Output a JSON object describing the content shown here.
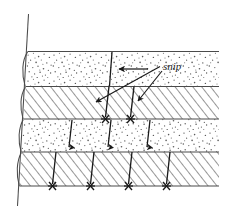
{
  "figure": {
    "kind": "technical-line-drawing",
    "background_color": "#ffffff",
    "ink_color": "#1a1a1a"
  },
  "annotations": [
    {
      "id": "snip-label",
      "text": "snip",
      "style": "italic",
      "x": 163,
      "y": 66,
      "leaders": 2
    }
  ],
  "courses": [
    {
      "index": 0,
      "fill": "stipple",
      "top": 51,
      "bottom": 86,
      "label": "upper-stipple-course"
    },
    {
      "index": 1,
      "fill": "hatch",
      "top": 86,
      "bottom": 119,
      "label": "upper-hatch-course"
    },
    {
      "index": 2,
      "fill": "stipple",
      "top": 119,
      "bottom": 152,
      "label": "lower-stipple-course"
    },
    {
      "index": 3,
      "fill": "hatch",
      "top": 152,
      "bottom": 186,
      "label": "lower-hatch-course"
    }
  ],
  "edge": {
    "label": "left-selvage-edge",
    "top_x": 27,
    "bottom_x": 18,
    "top_y": 15,
    "bottom_y": 205,
    "loops": 4
  },
  "snip_lines": [
    {
      "course": 1,
      "x_top": 109,
      "x_bottom": 105,
      "terminal": "star"
    },
    {
      "course": 1,
      "x_top": 134,
      "x_bottom": 130,
      "terminal": "star"
    },
    {
      "course": 2,
      "x_top": 72,
      "x_bottom": 69,
      "terminal": "arrow"
    },
    {
      "course": 2,
      "x_top": 111,
      "x_bottom": 108,
      "terminal": "arrow"
    },
    {
      "course": 2,
      "x_top": 150,
      "x_bottom": 147,
      "terminal": "arrow"
    },
    {
      "course": 3,
      "x_top": 56,
      "x_bottom": 52,
      "terminal": "star"
    },
    {
      "course": 3,
      "x_top": 94,
      "x_bottom": 90,
      "terminal": "star"
    },
    {
      "course": 3,
      "x_top": 132,
      "x_bottom": 128,
      "terminal": "star"
    },
    {
      "course": 3,
      "x_top": 170,
      "x_bottom": 166,
      "terminal": "star"
    }
  ],
  "dimension_arrow": {
    "label": "offset-dimension-arrow",
    "from_x": 148,
    "to_x": 117,
    "y": 69
  },
  "geometry": {
    "right_edge": 219,
    "left_edge": 20,
    "width": 230,
    "height": 215
  }
}
